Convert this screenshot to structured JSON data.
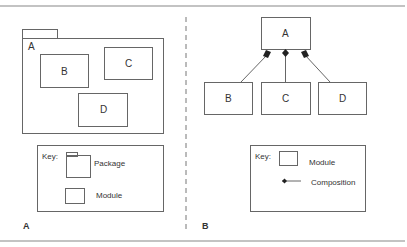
{
  "panels": {
    "A": {
      "caption": "A",
      "package": {
        "name": "A"
      },
      "modules": [
        "B",
        "C",
        "D"
      ],
      "key": {
        "title": "Key:",
        "items": [
          {
            "icon": "package-icon",
            "label": "Package"
          },
          {
            "icon": "module-icon",
            "label": "Module"
          }
        ]
      }
    },
    "B": {
      "caption": "B",
      "root": "A",
      "children": [
        "B",
        "C",
        "D"
      ],
      "key": {
        "title": "Key:",
        "items": [
          {
            "icon": "module-icon",
            "label": "Module"
          },
          {
            "icon": "composition-icon",
            "label": "Composition"
          }
        ]
      }
    }
  },
  "colors": {
    "stroke": "#666666",
    "fill": "#222222",
    "rule": "#888888"
  }
}
